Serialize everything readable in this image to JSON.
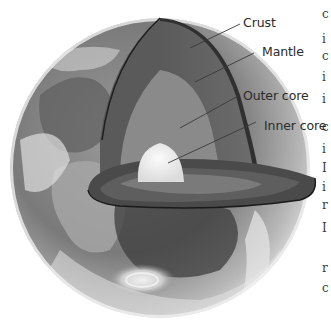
{
  "diagram": {
    "labels": [
      {
        "id": "crust",
        "text": "Crust"
      },
      {
        "id": "mantle",
        "text": "Mantle"
      },
      {
        "id": "outer_core",
        "text": "Outer core"
      },
      {
        "id": "inner_core",
        "text": "Inner core"
      }
    ],
    "colors": {
      "background": "#ffffff",
      "label_text": "#2b2b2b",
      "leader_line": "#3a3a3a",
      "crust_rim": "#2e2e2e",
      "mantle": "#6e6e6e",
      "outer_core": "#8e8e8e",
      "inner_core": "#efefef",
      "ocean": "#4a4a4a",
      "clouds": "#d8d8d8"
    }
  },
  "clipped_text_edge": {
    "glyphs": [
      "c",
      "i",
      "c",
      "i",
      "i",
      "c",
      "i",
      "I",
      "i",
      "r",
      "I",
      "r",
      "c"
    ]
  }
}
